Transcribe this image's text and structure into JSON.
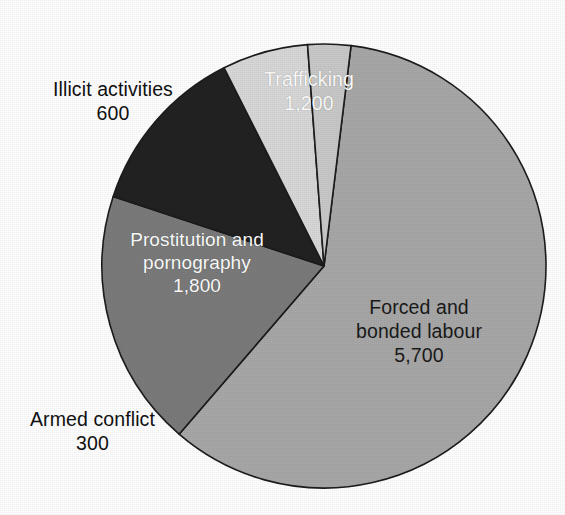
{
  "chart_data": {
    "type": "pie",
    "title": "",
    "subtitle": "",
    "xlabel": "",
    "ylabel": "",
    "legend_position": "none",
    "grid": false,
    "total": 9600,
    "units": "thousands",
    "start_angle_deg": 7,
    "direction": "clockwise",
    "center": {
      "x": 324,
      "y": 266
    },
    "radius": 222,
    "categories": [
      "Forced and bonded labour",
      "Prostitution and pornography",
      "Trafficking",
      "Illicit activities",
      "Armed conflict"
    ],
    "values": [
      5700,
      1800,
      1200,
      600,
      300
    ],
    "value_labels": [
      "5,700",
      "1,800",
      "1,200",
      "600",
      "300"
    ],
    "percentages": [
      59.4,
      18.8,
      12.5,
      6.3,
      3.1
    ],
    "colors": [
      "#a8a8a8",
      "#7b7b7b",
      "#222222",
      "#d8d8d8",
      "#c9c9c9"
    ],
    "slices": [
      {
        "id": "forced",
        "name": "Forced and bonded labour",
        "name_line1": "Forced and",
        "name_line2": "bonded labour",
        "value": 5700,
        "value_label": "5,700",
        "percent": 59.4,
        "angle_deg": 213.75,
        "color": "#a8a8a8",
        "label_placement": "inside",
        "label_color": "#1a1a1a"
      },
      {
        "id": "prostitution",
        "name": "Prostitution and pornography",
        "name_line1": "Prostitution and",
        "name_line2": "pornography",
        "value": 1800,
        "value_label": "1,800",
        "percent": 18.8,
        "angle_deg": 67.5,
        "color": "#7b7b7b",
        "label_placement": "inside",
        "label_color": "#ffffff"
      },
      {
        "id": "trafficking",
        "name": "Trafficking",
        "name_line1": "Trafficking",
        "name_line2": "",
        "value": 1200,
        "value_label": "1,200",
        "percent": 12.5,
        "angle_deg": 45,
        "color": "#222222",
        "label_placement": "inside",
        "label_color": "#ffffff"
      },
      {
        "id": "illicit",
        "name": "Illicit activities",
        "name_line1": "Illicit activities",
        "name_line2": "",
        "value": 600,
        "value_label": "600",
        "percent": 6.3,
        "angle_deg": 22.5,
        "color": "#d8d8d8",
        "label_placement": "outside",
        "label_color": "#111111"
      },
      {
        "id": "armed",
        "name": "Armed conflict",
        "name_line1": "Armed conflict",
        "name_line2": "",
        "value": 300,
        "value_label": "300",
        "percent": 3.1,
        "angle_deg": 11.25,
        "color": "#c9c9c9",
        "label_placement": "outside",
        "label_color": "#111111"
      }
    ],
    "stroke_color": "#1c1c1c",
    "background": "#ffffff"
  },
  "labels": {
    "forced": {
      "line1": "Forced and",
      "line2": "bonded labour",
      "value": "5,700"
    },
    "prostitution": {
      "line1": "Prostitution and",
      "line2": "pornography",
      "value": "1,800"
    },
    "trafficking": {
      "line1": "Trafficking",
      "value": "1,200"
    },
    "illicit": {
      "line1": "Illicit activities",
      "value": "600"
    },
    "armed": {
      "line1": "Armed conflict",
      "value": "300"
    }
  }
}
